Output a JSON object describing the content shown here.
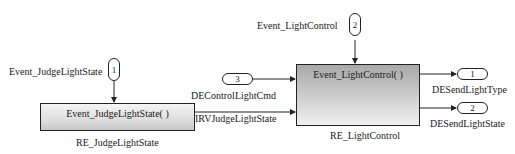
{
  "diagram": {
    "type": "simulink-autosar-runnables",
    "blocks": [
      {
        "id": "RE_JudgeLightState",
        "name_label": "RE_JudgeLightState",
        "title": "Event_JudgeLightState( )"
      },
      {
        "id": "RE_LightControl",
        "name_label": "RE_LightControl",
        "title": "Event_LightControl( )"
      }
    ],
    "inports": [
      {
        "number": "1",
        "label": "Event_JudgeLightState",
        "orientation": "vertical"
      },
      {
        "number": "2",
        "label": "Event_LightControl",
        "orientation": "vertical"
      },
      {
        "number": "3",
        "label": "DEControlLightCmd",
        "orientation": "horizontal"
      }
    ],
    "outports": [
      {
        "number": "1",
        "label": "DESendLightType"
      },
      {
        "number": "2",
        "label": "DESendLightState"
      }
    ],
    "signals": [
      {
        "label": "IRVJudgeLightState",
        "from": "RE_JudgeLightState",
        "to": "RE_LightControl"
      }
    ],
    "colors": {
      "line": "#222222",
      "background": "#ffffff"
    }
  }
}
